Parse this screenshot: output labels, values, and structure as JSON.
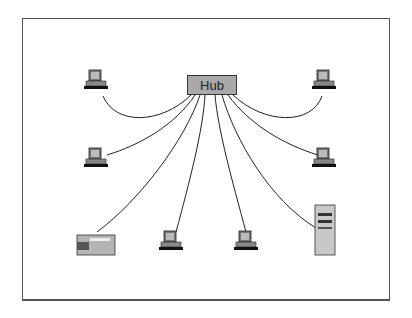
{
  "diagram": {
    "type": "star-topology",
    "hub": {
      "label": "Hub",
      "fill": "#a9a9a9"
    },
    "line_color": "#222222",
    "nodes": [
      {
        "id": "pc-top-left",
        "kind": "workstation"
      },
      {
        "id": "pc-mid-left",
        "kind": "workstation"
      },
      {
        "id": "printer",
        "kind": "printer"
      },
      {
        "id": "pc-bottom-center-left",
        "kind": "workstation"
      },
      {
        "id": "pc-bottom-center-right",
        "kind": "workstation"
      },
      {
        "id": "server",
        "kind": "server"
      },
      {
        "id": "pc-mid-right",
        "kind": "workstation"
      },
      {
        "id": "pc-top-right",
        "kind": "workstation"
      }
    ]
  }
}
